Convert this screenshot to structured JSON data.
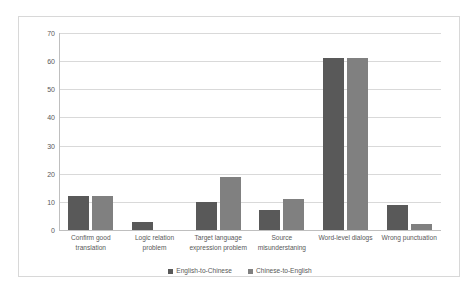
{
  "chart_data": {
    "type": "bar",
    "title": "",
    "subtitle": "",
    "xlabel": "",
    "ylabel": "",
    "ylim": [
      0,
      70
    ],
    "ytick_step": 10,
    "yticks": [
      70,
      60,
      50,
      40,
      30,
      20,
      10,
      0
    ],
    "grid": true,
    "legend_position": "bottom",
    "categories": [
      "Confirm good translation",
      "Logic relation problem",
      "Target language expression problem",
      "Source misunderstaning",
      "Word-level dialogs",
      "Wrong punctuation"
    ],
    "series": [
      {
        "name": "English-to-Chinese",
        "color": "#595959",
        "values": [
          12,
          3,
          10,
          7,
          61,
          9
        ]
      },
      {
        "name": "Chinese-to-English",
        "color": "#808080",
        "values": [
          12,
          0,
          19,
          11,
          61,
          2
        ]
      }
    ]
  },
  "legend": {
    "items": [
      {
        "label": "English-to-Chinese"
      },
      {
        "label": "Chinese-to-English"
      }
    ]
  }
}
